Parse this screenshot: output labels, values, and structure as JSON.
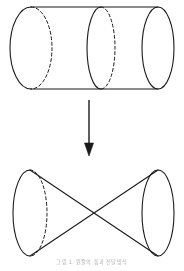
{
  "figure": {
    "caption": "그림 1. 원뿔의 통과 전달방식",
    "stroke_color": "#1a1a1a",
    "background_color": "#ffffff",
    "stroke_width": 1.0,
    "dash_pattern": "3,2.5"
  },
  "shapes": {
    "cylinder": {
      "label": "cylinder",
      "left_ellipse": {
        "label": "cylinder-left-cap",
        "cx": 31,
        "cy": 48,
        "rx": 21,
        "ry": 41,
        "front_arc": "solid",
        "back_arc": "dashed"
      },
      "middle_ellipse": {
        "label": "cylinder-cross-section",
        "cx": 101,
        "cy": 48,
        "rx": 14,
        "ry": 41,
        "front_arc": "solid",
        "back_arc": "dashed"
      },
      "right_ellipse": {
        "label": "cylinder-right-cap",
        "cx": 158,
        "cy": 48,
        "rx": 16,
        "ry": 41,
        "front_arc": "solid",
        "back_arc": "solid"
      },
      "top_edge": {
        "x1": 31,
        "y1": 7,
        "x2": 158,
        "y2": 7
      },
      "bottom_edge": {
        "x1": 31,
        "y1": 89,
        "x2": 158,
        "y2": 89
      }
    },
    "arrow": {
      "label": "downward-transformation-arrow",
      "direction": "down",
      "x": 89,
      "y_start": 100,
      "y_end": 155,
      "head_width": 9,
      "head_length": 11
    },
    "double_cone": {
      "label": "double-cone-bowtie",
      "apex": {
        "x": 92,
        "y": 213
      },
      "left_ellipse": {
        "label": "left-cone-base",
        "cx": 30,
        "cy": 213,
        "rx": 17,
        "ry": 43,
        "front_arc": "solid",
        "back_arc": "dashed"
      },
      "right_ellipse": {
        "label": "right-cone-base",
        "cx": 158,
        "cy": 213,
        "rx": 16,
        "ry": 43,
        "front_arc": "solid",
        "back_arc": "solid"
      },
      "generatrices": [
        {
          "x1": 30,
          "y1": 170,
          "x2": 158,
          "y2": 256
        },
        {
          "x1": 30,
          "y1": 256,
          "x2": 158,
          "y2": 170
        }
      ]
    }
  }
}
